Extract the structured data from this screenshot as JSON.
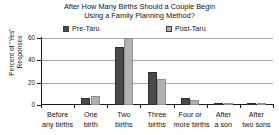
{
  "chart_data": {
    "type": "bar",
    "title": "After How Many Births Should a Couple Begin Using a Family Planning Method?",
    "title_line1": "After How Many Births Should a Couple Begin",
    "title_line2": "Using a Family Planning Method?",
    "xlabel": "",
    "ylabel": "Percent of \"Yes\" Responses",
    "ylabel_line1": "Percent of \"Yes\"",
    "ylabel_line2": "Responses",
    "ylim": [
      0,
      60
    ],
    "yticks": [
      0,
      20,
      40,
      60
    ],
    "ytick_labels": [
      "0",
      "20",
      "40",
      "60"
    ],
    "grid": true,
    "legend_position": "top",
    "categories": [
      "Before any births",
      "One birth",
      "Two births",
      "Three births",
      "Four or more births",
      "After a son",
      "After two sons"
    ],
    "category_lines": [
      [
        "Before",
        "any births"
      ],
      [
        "One",
        "birth"
      ],
      [
        "Two",
        "births"
      ],
      [
        "Three",
        "births"
      ],
      [
        "Four or",
        "more births"
      ],
      [
        "After",
        "a son"
      ],
      [
        "After",
        "two sons"
      ]
    ],
    "series": [
      {
        "name": "Pre-Taru",
        "color": "#4a4a4a",
        "values": [
          0,
          6.5,
          52,
          30,
          6.5,
          1,
          0.7
        ]
      },
      {
        "name": "Post-Taru",
        "color": "#b2b2b2",
        "values": [
          0,
          8,
          60,
          23,
          4.5,
          0.7,
          0.7
        ]
      }
    ]
  },
  "legend": {
    "items": [
      {
        "label": "Pre-Taru",
        "color": "#4a4a4a"
      },
      {
        "label": "Post-Taru",
        "color": "#b2b2b2"
      }
    ]
  },
  "colors": {
    "pre": "#4a4a4a",
    "post": "#b2b2b2",
    "grid": "#a8a8a8",
    "axis": "#1a1a1a",
    "background": "#ffffff"
  }
}
